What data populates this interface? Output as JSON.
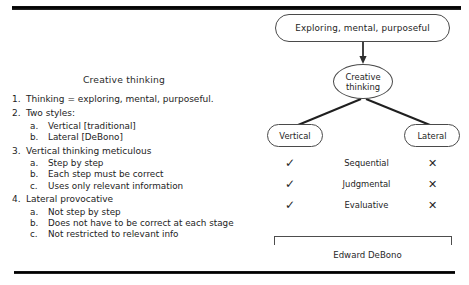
{
  "slide": {
    "left_panel": {
      "title": "Creative thinking",
      "items": [
        {
          "num": "1.",
          "text": "Thinking = exploring, mental, purposeful.",
          "subitems": []
        },
        {
          "num": "2.",
          "text": "Two styles:",
          "subitems": [
            {
              "alpha": "a.",
              "text": "Vertical [traditional]"
            },
            {
              "alpha": "b.",
              "text": "Lateral [DeBono]"
            }
          ]
        },
        {
          "num": "3.",
          "text": "Vertical thinking meticulous",
          "subitems": [
            {
              "alpha": "a.",
              "text": "Step by step"
            },
            {
              "alpha": "b.",
              "text": "Each step must be correct"
            },
            {
              "alpha": "c.",
              "text": "Uses only relevant information"
            }
          ]
        },
        {
          "num": "4.",
          "text": "Lateral provocative",
          "subitems": [
            {
              "alpha": "a.",
              "text": "Not step by step"
            },
            {
              "alpha": "b.",
              "text": "Does not have to be correct at each stage"
            },
            {
              "alpha": "c.",
              "text": "Not restricted to relevant info"
            }
          ]
        }
      ]
    },
    "right_panel": {
      "nodes": {
        "root": "Exploring, mental, purposeful",
        "creative": "Creative\nthinking",
        "creative_line1": "Creative",
        "creative_line2": "thinking",
        "vertical": "Vertical",
        "lateral": "Lateral"
      },
      "comparison": {
        "yes_mark": "✓",
        "no_mark": "✕",
        "rows": [
          {
            "vertical": "✓",
            "label": "Sequential",
            "lateral": "✕"
          },
          {
            "vertical": "✓",
            "label": "Judgmental",
            "lateral": "✕"
          },
          {
            "vertical": "✓",
            "label": "Evaluative",
            "lateral": "✕"
          }
        ]
      },
      "credit": "Edward DeBono"
    }
  },
  "colors": {
    "ink": "#232323",
    "stroke": "#4a4a4a",
    "bar": "#000000",
    "background": "#ffffff"
  }
}
